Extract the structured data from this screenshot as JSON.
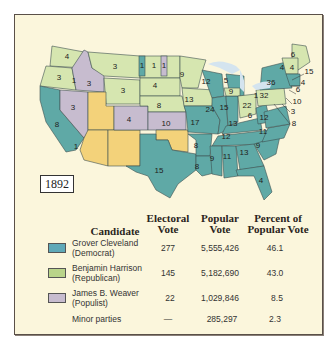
{
  "map": {
    "year": "1892",
    "colors": {
      "democrat": "#5fa9a6",
      "republican": "#d6e6b0",
      "populist": "#c7bccf",
      "territory": "#f3d27a",
      "lakes": "#d4e4ef",
      "border": "#3e5050"
    },
    "state_labels": [
      {
        "label": "4",
        "party": "republican"
      },
      {
        "label": "3",
        "party": "republican"
      },
      {
        "label": "1",
        "party": "republican"
      },
      {
        "label": "3",
        "party": "populist"
      },
      {
        "label": "3",
        "party": "populist"
      },
      {
        "label": "8",
        "party": "democrat"
      },
      {
        "label": "1",
        "party": "republican"
      },
      {
        "label": "3",
        "party": "republican"
      },
      {
        "label": "3",
        "party": "republican"
      },
      {
        "label": "1",
        "party": "democrat"
      },
      {
        "label": "1",
        "party": "republican"
      },
      {
        "label": "1",
        "party": "populist"
      },
      {
        "label": "4",
        "party": "republican"
      },
      {
        "label": "8",
        "party": "republican"
      },
      {
        "label": "4",
        "party": "populist"
      },
      {
        "label": "10",
        "party": "populist"
      },
      {
        "label": "9",
        "party": "republican"
      },
      {
        "label": "13",
        "party": "republican"
      },
      {
        "label": "12",
        "party": "democrat"
      },
      {
        "label": "5",
        "party": "democrat"
      },
      {
        "label": "9",
        "party": "republican"
      },
      {
        "label": "24",
        "party": "democrat"
      },
      {
        "label": "15",
        "party": "democrat"
      },
      {
        "label": "22",
        "party": "republican"
      },
      {
        "label": "1",
        "party": "republican"
      },
      {
        "label": "17",
        "party": "democrat"
      },
      {
        "label": "13",
        "party": "democrat"
      },
      {
        "label": "6",
        "party": "democrat"
      },
      {
        "label": "12",
        "party": "democrat"
      },
      {
        "label": "36",
        "party": "democrat"
      },
      {
        "label": "32",
        "party": "republican"
      },
      {
        "label": "6",
        "party": "republican"
      },
      {
        "label": "4",
        "party": "republican"
      },
      {
        "label": "4",
        "party": "republican"
      },
      {
        "label": "15",
        "party": "republican"
      },
      {
        "label": "4",
        "party": "republican"
      },
      {
        "label": "6",
        "party": "democrat"
      },
      {
        "label": "10",
        "party": "democrat"
      },
      {
        "label": "3",
        "party": "democrat"
      },
      {
        "label": "8",
        "party": "democrat"
      },
      {
        "label": "12",
        "party": "democrat"
      },
      {
        "label": "11",
        "party": "democrat"
      },
      {
        "label": "9",
        "party": "democrat"
      },
      {
        "label": "8",
        "party": "democrat"
      },
      {
        "label": "9",
        "party": "democrat"
      },
      {
        "label": "11",
        "party": "democrat"
      },
      {
        "label": "13",
        "party": "democrat"
      },
      {
        "label": "8",
        "party": "democrat"
      },
      {
        "label": "15",
        "party": "democrat"
      },
      {
        "label": "4",
        "party": "democrat"
      }
    ]
  },
  "table": {
    "headers": {
      "candidate": "Candidate",
      "electoral_1": "Electoral",
      "electoral_2": "Vote",
      "popular_1": "Popular",
      "popular_2": "Vote",
      "percent_1": "Percent of",
      "percent_2": "Popular Vote"
    },
    "rows": [
      {
        "name_1": "Grover Cleveland",
        "name_2": "(Democrat)",
        "electoral": "277",
        "popular": "5,555,426",
        "percent": "46.1",
        "color": "#5fa9b8"
      },
      {
        "name_1": "Benjamin Harrison",
        "name_2": "(Republican)",
        "electoral": "145",
        "popular": "5,182,690",
        "percent": "43.0",
        "color": "#b9d48a"
      },
      {
        "name_1": "James B. Weaver",
        "name_2": "(Populist)",
        "electoral": "22",
        "popular": "1,029,846",
        "percent": "8.5",
        "color": "#c7bccf"
      },
      {
        "name_1": "Minor parties",
        "name_2": "",
        "electoral": "—",
        "popular": "285,297",
        "percent": "2.3",
        "color": ""
      }
    ]
  }
}
